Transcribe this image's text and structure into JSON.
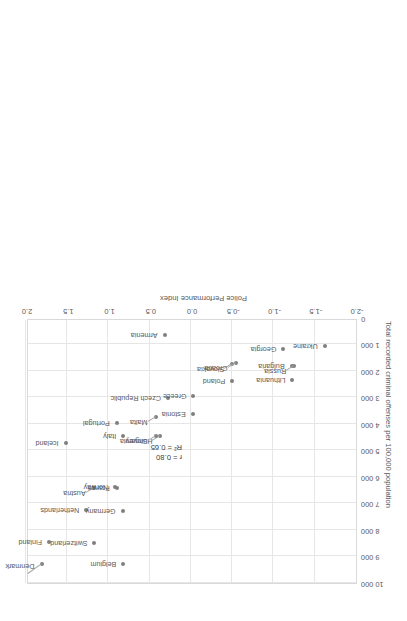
{
  "chart_data": {
    "type": "scatter",
    "title": "",
    "xlabel": "Police Performance Index",
    "ylabel": "Total recorded criminal offenses per 100,000 population",
    "xlim": [
      -2.0,
      2.0
    ],
    "ylim": [
      0,
      10000
    ],
    "xticks": [
      "-2.0",
      "-1.5",
      "-1.0",
      "-0.5",
      "0.0",
      "0.5",
      "1.0",
      "1.5",
      "2.0"
    ],
    "xtick_values": [
      -2.0,
      -1.5,
      -1.0,
      -0.5,
      0.0,
      0.5,
      1.0,
      1.5,
      2.0
    ],
    "yticks": [
      "0",
      "1 000",
      "2 000",
      "3 000",
      "4 000",
      "5 000",
      "6 000",
      "7 000",
      "8 000",
      "9 000",
      "10 000"
    ],
    "ytick_values": [
      0,
      1000,
      2000,
      3000,
      4000,
      5000,
      6000,
      7000,
      8000,
      9000,
      10000
    ],
    "grid": true,
    "legend": "none",
    "rotated_180": true,
    "annotations": {
      "r": "r = 0.80",
      "r_squared": "R² = 0.65"
    },
    "points": [
      {
        "name": "Denmark",
        "x": 1.8,
        "y": 9300,
        "lx": 8,
        "ly": -2,
        "anchor": "left",
        "leader": true,
        "lead_dx": 14,
        "lead_dy": -10
      },
      {
        "name": "Finland",
        "x": 1.72,
        "y": 8450,
        "lx": 7,
        "ly": 0,
        "anchor": "left",
        "leader": false
      },
      {
        "name": "Belgium",
        "x": 0.82,
        "y": 9300,
        "lx": 7,
        "ly": 0,
        "anchor": "left",
        "leader": false
      },
      {
        "name": "Switzerland",
        "x": 1.17,
        "y": 8500,
        "lx": 7,
        "ly": 0,
        "anchor": "left",
        "leader": false
      },
      {
        "name": "Netherlands",
        "x": 1.27,
        "y": 7250,
        "lx": 7,
        "ly": 0,
        "anchor": "left",
        "leader": false
      },
      {
        "name": "Germany",
        "x": 0.83,
        "y": 7270,
        "lx": 7,
        "ly": 0,
        "anchor": "left",
        "leader": false
      },
      {
        "name": "Austria",
        "x": 1.18,
        "y": 6400,
        "lx": 8,
        "ly": -5,
        "anchor": "left",
        "leader": true,
        "lead_dx": 8,
        "lead_dy": -5
      },
      {
        "name": "Norway",
        "x": 0.92,
        "y": 6380,
        "lx": 7,
        "ly": 0,
        "anchor": "left",
        "leader": false
      },
      {
        "name": "France",
        "x": 0.9,
        "y": 6420,
        "lx": 7,
        "ly": 0,
        "anchor": "left",
        "leader": false
      },
      {
        "name": "Iceland",
        "x": 1.52,
        "y": 4730,
        "lx": 7,
        "ly": 0,
        "anchor": "left",
        "leader": false
      },
      {
        "name": "Italy",
        "x": 0.82,
        "y": 4450,
        "lx": 7,
        "ly": 0,
        "anchor": "left",
        "leader": false
      },
      {
        "name": "Portugal",
        "x": 0.9,
        "y": 3980,
        "lx": 7,
        "ly": 0,
        "anchor": "left",
        "leader": false
      },
      {
        "name": "Hungary",
        "x": 0.37,
        "y": 4470,
        "lx": 8,
        "ly": -5,
        "anchor": "left",
        "leader": true,
        "lead_dx": 8,
        "lead_dy": -5
      },
      {
        "name": "Slovenia",
        "x": 0.43,
        "y": 4440,
        "lx": 8,
        "ly": -5,
        "anchor": "left",
        "leader": true,
        "lead_dx": 8,
        "lead_dy": -5
      },
      {
        "name": "Malta",
        "x": 0.43,
        "y": 3730,
        "lx": 8,
        "ly": -5,
        "anchor": "left",
        "leader": true,
        "lead_dx": 8,
        "lead_dy": -5
      },
      {
        "name": "Czech Republic",
        "x": 0.28,
        "y": 3030,
        "lx": 7,
        "ly": 0,
        "anchor": "left",
        "leader": false
      },
      {
        "name": "Estonia",
        "x": -0.02,
        "y": 3620,
        "lx": 7,
        "ly": 0,
        "anchor": "left",
        "leader": false
      },
      {
        "name": "Greece",
        "x": -0.03,
        "y": 2950,
        "lx": 7,
        "ly": 0,
        "anchor": "left",
        "leader": false
      },
      {
        "name": "Poland",
        "x": -0.5,
        "y": 2380,
        "lx": 7,
        "ly": 0,
        "anchor": "left",
        "leader": false
      },
      {
        "name": "Slovakia",
        "x": -0.5,
        "y": 1740,
        "lx": 8,
        "ly": -5,
        "anchor": "left",
        "leader": true,
        "lead_dx": 8,
        "lead_dy": -5
      },
      {
        "name": "Croatia",
        "x": -0.54,
        "y": 1680,
        "lx": 8,
        "ly": -5,
        "anchor": "left",
        "leader": true,
        "lead_dx": 8,
        "lead_dy": -5
      },
      {
        "name": "Lithuania",
        "x": -1.23,
        "y": 2340,
        "lx": 7,
        "ly": 0,
        "anchor": "left",
        "leader": false
      },
      {
        "name": "Bulgaria",
        "x": -1.22,
        "y": 1830,
        "lx": 7,
        "ly": 0,
        "anchor": "left",
        "leader": false
      },
      {
        "name": "Russia",
        "x": -1.25,
        "y": 1820,
        "lx": 8,
        "ly": -5,
        "anchor": "left",
        "leader": true,
        "lead_dx": 8,
        "lead_dy": -5
      },
      {
        "name": "Georgia",
        "x": -1.12,
        "y": 1170,
        "lx": 7,
        "ly": 0,
        "anchor": "left",
        "leader": false
      },
      {
        "name": "Armenia",
        "x": 0.32,
        "y": 660,
        "lx": 7,
        "ly": 0,
        "anchor": "left",
        "leader": false
      },
      {
        "name": "Ukraine",
        "x": -1.62,
        "y": 1070,
        "lx": 7,
        "ly": 0,
        "anchor": "left",
        "leader": false
      }
    ]
  },
  "colors": {
    "point": "#7f7f7f",
    "grid": "#e6e6e6",
    "border": "#d9d9d9",
    "text": "#595959"
  }
}
